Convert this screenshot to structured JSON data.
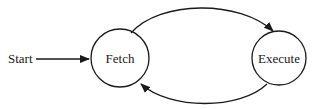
{
  "diagram": {
    "type": "state-machine",
    "start_label": "Start",
    "states": [
      {
        "id": "fetch",
        "label": "Fetch"
      },
      {
        "id": "execute",
        "label": "Execute"
      }
    ],
    "transitions": [
      {
        "from": "start",
        "to": "fetch"
      },
      {
        "from": "fetch",
        "to": "execute"
      },
      {
        "from": "execute",
        "to": "fetch"
      }
    ],
    "colors": {
      "stroke": "#1a1a1a",
      "background": "#ffffff"
    }
  }
}
